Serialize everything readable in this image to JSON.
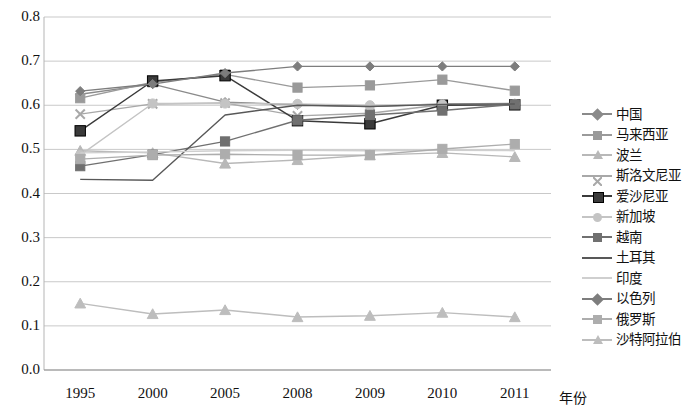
{
  "chart_data": {
    "type": "line",
    "title": "",
    "xlabel": "年份",
    "ylabel": "",
    "categories": [
      "1995",
      "2000",
      "2005",
      "2008",
      "2009",
      "2010",
      "2011"
    ],
    "ylim": [
      0.0,
      0.8
    ],
    "ytick_labels": [
      "0.0",
      "0.1",
      "0.2",
      "0.3",
      "0.4",
      "0.5",
      "0.6",
      "0.7",
      "0.8"
    ],
    "ytick_values": [
      0.0,
      0.1,
      0.2,
      0.3,
      0.4,
      0.5,
      0.6,
      0.7,
      0.8
    ],
    "grid": "horizontal",
    "legend_position": "right",
    "series": [
      {
        "name": "中国",
        "marker": "diamond",
        "color": "#8a8a8a",
        "values": [
          0.625,
          0.648,
          0.607,
          0.601,
          0.597,
          0.603,
          0.604
        ]
      },
      {
        "name": "马来西亚",
        "marker": "square",
        "color": "#9a9a9a",
        "values": [
          0.616,
          0.652,
          0.67,
          0.64,
          0.645,
          0.658,
          0.633
        ]
      },
      {
        "name": "波兰",
        "marker": "triangle",
        "color": "#b8b8b8",
        "values": [
          0.497,
          0.492,
          0.468,
          0.476,
          0.487,
          0.492,
          0.483
        ]
      },
      {
        "name": "斯洛文尼亚",
        "marker": "x",
        "color": "#a8a8a8",
        "values": [
          0.58,
          0.603,
          0.605,
          0.576,
          0.582,
          0.601,
          0.602
        ]
      },
      {
        "name": "爱沙尼亚",
        "marker": "filled-square",
        "color": "#3a3a3a",
        "values": [
          0.542,
          0.655,
          0.667,
          0.565,
          0.558,
          0.6,
          0.601
        ]
      },
      {
        "name": "新加坡",
        "marker": "circle",
        "color": "#c4c4c4",
        "values": [
          0.487,
          0.604,
          0.604,
          0.603,
          0.6,
          0.602,
          0.603
        ]
      },
      {
        "name": "越南",
        "marker": "square",
        "color": "#707070",
        "values": [
          0.462,
          0.488,
          0.518,
          0.566,
          0.578,
          0.588,
          0.602
        ]
      },
      {
        "name": "土耳其",
        "marker": "none",
        "color": "#585858",
        "values": [
          0.432,
          0.43,
          0.578,
          0.6,
          0.597,
          0.602,
          0.603
        ]
      },
      {
        "name": "印度",
        "marker": "none",
        "color": "#cfcfcf",
        "values": [
          0.492,
          0.494,
          0.497,
          0.498,
          0.497,
          0.498,
          0.497
        ]
      },
      {
        "name": "以色列",
        "marker": "diamond",
        "color": "#7d7d7d",
        "values": [
          0.632,
          0.648,
          0.673,
          0.688,
          0.688,
          0.688,
          0.688
        ]
      },
      {
        "name": "俄罗斯",
        "marker": "square",
        "color": "#adadad",
        "values": [
          0.478,
          0.487,
          0.489,
          0.487,
          0.487,
          0.501,
          0.512
        ]
      },
      {
        "name": "沙特阿拉伯",
        "marker": "triangle",
        "color": "#bdbdbd",
        "values": [
          0.151,
          0.127,
          0.136,
          0.12,
          0.123,
          0.13,
          0.12
        ]
      }
    ]
  }
}
